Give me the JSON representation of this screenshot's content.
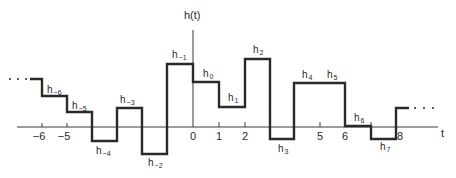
{
  "diagram": {
    "vertical_axis_label": "h(t)",
    "horizontal_axis_label": "t",
    "continuation_left": ". . .",
    "continuation_right": ". . .",
    "ticks": [
      {
        "label": "−6",
        "x": 42
      },
      {
        "label": "−5",
        "x": 67
      },
      {
        "label": "0",
        "x": 193
      },
      {
        "label": "1",
        "x": 219
      },
      {
        "label": "2",
        "x": 245
      },
      {
        "label": "5",
        "x": 320
      },
      {
        "label": "6",
        "x": 345
      },
      {
        "label": "8",
        "x": 397
      }
    ],
    "segments": [
      {
        "name": "h",
        "sub": "−6",
        "t_start": -6,
        "t_end": -5,
        "label_x": 47,
        "label_y": 93
      },
      {
        "name": "h",
        "sub": "−5",
        "t_start": -5,
        "t_end": -4,
        "label_x": 72,
        "label_y": 109
      },
      {
        "name": "h",
        "sub": "−4",
        "t_start": -4,
        "t_end": -3,
        "label_x": 96,
        "label_y": 154
      },
      {
        "name": "h",
        "sub": "−3",
        "t_start": -3,
        "t_end": -2,
        "label_x": 120,
        "label_y": 103
      },
      {
        "name": "h",
        "sub": "−2",
        "t_start": -2,
        "t_end": -1,
        "label_x": 148,
        "label_y": 166
      },
      {
        "name": "h",
        "sub": "−1",
        "t_start": -1,
        "t_end": 0,
        "label_x": 172,
        "label_y": 58
      },
      {
        "name": "h",
        "sub": "0",
        "t_start": 0,
        "t_end": 1,
        "label_x": 203,
        "label_y": 77
      },
      {
        "name": "h",
        "sub": "1",
        "t_start": 1,
        "t_end": 2,
        "label_x": 228,
        "label_y": 101
      },
      {
        "name": "h",
        "sub": "2",
        "t_start": 2,
        "t_end": 3,
        "label_x": 253,
        "label_y": 53
      },
      {
        "name": "h",
        "sub": "3",
        "t_start": 3,
        "t_end": 4,
        "label_x": 278,
        "label_y": 152
      },
      {
        "name": "h",
        "sub": "4",
        "t_start": 4,
        "t_end": 5,
        "label_x": 302,
        "label_y": 78
      },
      {
        "name": "h",
        "sub": "5",
        "t_start": 5,
        "t_end": 6,
        "label_x": 327,
        "label_y": 78
      },
      {
        "name": "h",
        "sub": "6",
        "t_start": 6,
        "t_end": 7,
        "label_x": 354,
        "label_y": 121
      },
      {
        "name": "h",
        "sub": "7",
        "t_start": 7,
        "t_end": 8,
        "label_x": 380,
        "label_y": 150
      }
    ],
    "colors": {
      "line": "#2a2a2a",
      "axis": "#3a3a3a",
      "background": "#ffffff"
    }
  }
}
